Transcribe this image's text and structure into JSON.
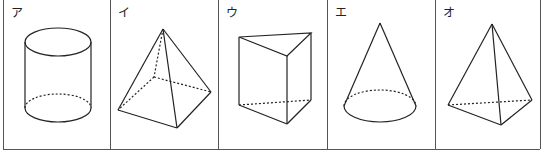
{
  "figures": [
    {
      "label": "ア",
      "shape": "cylinder"
    },
    {
      "label": "イ",
      "shape": "square-pyramid"
    },
    {
      "label": "ウ",
      "shape": "triangular-prism"
    },
    {
      "label": "エ",
      "shape": "cone"
    },
    {
      "label": "オ",
      "shape": "triangular-pyramid"
    }
  ],
  "colors": {
    "line": "#222222",
    "border": "#555555"
  }
}
